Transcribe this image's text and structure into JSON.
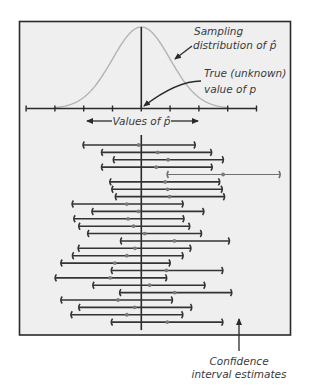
{
  "labels": {
    "sampling_line1": "Sampling",
    "sampling_line2": "distribution of p̂",
    "true_line1": "True (unknown)",
    "true_line2": "value of p",
    "axis_label": "Values of p̂",
    "ci_line1": "Confidence",
    "ci_line2": "interval estimates"
  },
  "colors": {
    "frame_fill": "#efefef",
    "frame_stroke": "#2a2a2a",
    "curve": "#b3b3b3",
    "interval": "#333333",
    "interval_miss": "#6f6f6f",
    "estimate_dot": "#7a7a7a",
    "axis": "#2a2a2a"
  },
  "distribution": {
    "type": "normal",
    "true_p": 0,
    "sd_units": 1,
    "tick_positions_sd": [
      -4,
      -3,
      -2,
      -1,
      0,
      1,
      2,
      3,
      4
    ]
  },
  "intervals": [
    {
      "low": -2.03,
      "est": -0.09,
      "high": 1.88,
      "captures": true
    },
    {
      "low": -1.39,
      "est": 0.57,
      "high": 2.45,
      "captures": true
    },
    {
      "low": -0.98,
      "est": 0.93,
      "high": 2.86,
      "captures": true
    },
    {
      "low": -1.39,
      "est": 0.52,
      "high": 2.47,
      "captures": true
    },
    {
      "low": 0.89,
      "est": 2.84,
      "high": 4.83,
      "captures": false
    },
    {
      "low": -1.1,
      "est": 0.83,
      "high": 2.73,
      "captures": true
    },
    {
      "low": -1.03,
      "est": 0.91,
      "high": 2.82,
      "captures": true
    },
    {
      "low": -0.91,
      "est": 0.98,
      "high": 2.9,
      "captures": true
    },
    {
      "low": -2.41,
      "est": -0.5,
      "high": 1.46,
      "captures": true
    },
    {
      "low": -1.72,
      "est": -0.1,
      "high": 2.18,
      "captures": true
    },
    {
      "low": -2.35,
      "est": -0.46,
      "high": 1.49,
      "captures": true
    },
    {
      "low": -2.18,
      "est": -0.27,
      "high": 1.69,
      "captures": true
    },
    {
      "low": -1.87,
      "est": 0.12,
      "high": 2.1,
      "captures": true
    },
    {
      "low": -0.73,
      "est": 1.15,
      "high": 3.07,
      "captures": true
    },
    {
      "low": -2.2,
      "est": -0.22,
      "high": 1.73,
      "captures": true
    },
    {
      "low": -2.4,
      "est": -0.5,
      "high": 1.46,
      "captures": true
    },
    {
      "low": -2.8,
      "est": -0.92,
      "high": 1.01,
      "captures": true
    },
    {
      "low": -1.05,
      "est": 0.87,
      "high": 2.84,
      "captures": true
    },
    {
      "low": -3.0,
      "est": -1.08,
      "high": 0.89,
      "captures": true
    },
    {
      "low": -1.69,
      "est": 0.29,
      "high": 2.22,
      "captures": true
    },
    {
      "low": -0.76,
      "est": 1.16,
      "high": 3.15,
      "captures": true
    },
    {
      "low": -2.8,
      "est": -0.81,
      "high": 1.09,
      "captures": true
    },
    {
      "low": -2.18,
      "est": -0.23,
      "high": 1.76,
      "captures": true
    },
    {
      "low": -2.45,
      "est": -0.5,
      "high": 1.45,
      "captures": true
    },
    {
      "low": -1.05,
      "est": 0.9,
      "high": 2.84,
      "captures": true
    }
  ]
}
